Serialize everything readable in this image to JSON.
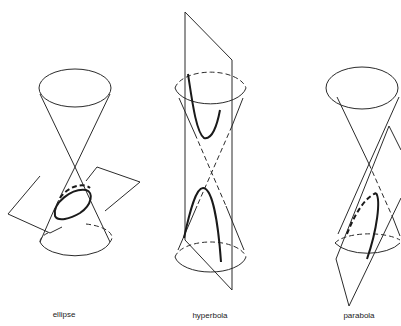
{
  "figure": {
    "panels": [
      {
        "id": "ellipse",
        "label": "ellipse"
      },
      {
        "id": "hyperbola",
        "label": "hyperbola"
      },
      {
        "id": "parabola",
        "label": "parabola"
      }
    ]
  },
  "colors": {
    "line": "#2b2b2b",
    "background": "#ffffff"
  }
}
